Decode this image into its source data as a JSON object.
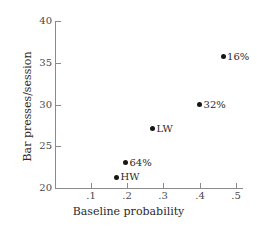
{
  "chart_data": {
    "type": "scatter",
    "title": "",
    "xlabel": "Baseline probability",
    "ylabel": "Bar presses/session",
    "xlim": [
      0.0,
      0.52
    ],
    "ylim": [
      20,
      40
    ],
    "grid": false,
    "legend": "none",
    "xticks": [
      ".1",
      ".2",
      ".3",
      ".4",
      ".5"
    ],
    "xtick_values": [
      0.1,
      0.2,
      0.3,
      0.4,
      0.5
    ],
    "yticks": [
      "20",
      "25",
      "30",
      "35",
      "40"
    ],
    "ytick_values": [
      20,
      25,
      30,
      35,
      40
    ],
    "points": [
      {
        "label": "HW",
        "x": 0.17,
        "y": 21.3,
        "label_side": "right"
      },
      {
        "label": "64%",
        "x": 0.195,
        "y": 23.0,
        "label_side": "right"
      },
      {
        "label": "LW",
        "x": 0.27,
        "y": 27.1,
        "label_side": "right"
      },
      {
        "label": "32%",
        "x": 0.4,
        "y": 30.0,
        "label_side": "right"
      },
      {
        "label": "16%",
        "x": 0.465,
        "y": 35.7,
        "label_side": "right"
      }
    ],
    "marker_color": "#161616",
    "axis_color": "#8a8a8a"
  }
}
